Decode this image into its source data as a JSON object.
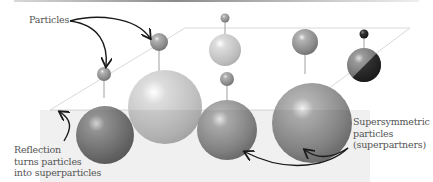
{
  "diagram": {
    "type": "supersymmetry-illustration",
    "labels": {
      "particles": "Particles",
      "reflection": [
        "Reflection",
        "turns particles",
        "into superparticles"
      ],
      "superpartners": [
        "Supersymmetric",
        "particles",
        "(superpartners)"
      ]
    },
    "colors": {
      "background": "#ffffff",
      "plane_edge": "#d9d9d9",
      "text": "#555555",
      "arrow": "#1a1a1a",
      "sphere_mid": "#8c8c8c",
      "sphere_light": "#c4c4c4",
      "sphere_dark": "#2a2a2a"
    },
    "particle_pairs": [
      {
        "particle": "small-mid-gray",
        "superpartner": "large-mid-gray"
      },
      {
        "particle": "small-light-gray",
        "superpartner": "large-light-gray"
      },
      {
        "particle": "tiny-light-gray",
        "superpartner": "medium-light-gray"
      },
      {
        "particle": "small-mid-gray",
        "superpartner": "large-mid-gray"
      },
      {
        "particle": "small-mid-gray",
        "superpartner": "extra-large-mid-gray"
      },
      {
        "particle": "tiny-black",
        "superpartner": "medium-half-black"
      }
    ]
  }
}
